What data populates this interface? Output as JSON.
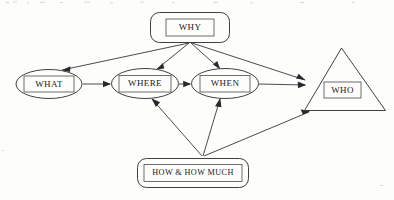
{
  "diagram": {
    "background_color": "#fdfdfc",
    "line_color": "#2a2a2a",
    "text_color": "#1a1a1a",
    "nodes": [
      {
        "id": "why",
        "label": "WHY",
        "shape": "rounded-rectangle",
        "x": 190,
        "y": 27
      },
      {
        "id": "what",
        "label": "WHAT",
        "shape": "ellipse",
        "x": 49,
        "y": 84
      },
      {
        "id": "where",
        "label": "WHERE",
        "shape": "ellipse",
        "x": 145,
        "y": 83
      },
      {
        "id": "when",
        "label": "WHEN",
        "shape": "ellipse",
        "x": 225,
        "y": 83
      },
      {
        "id": "who",
        "label": "WHO",
        "shape": "triangle",
        "x": 342,
        "y": 90
      },
      {
        "id": "how",
        "label": "HOW & HOW MUCH",
        "shape": "rounded-rectangle",
        "x": 193,
        "y": 173
      }
    ],
    "edges": [
      {
        "from": "why",
        "to": "what",
        "arrow": "single"
      },
      {
        "from": "why",
        "to": "where",
        "arrow": "single"
      },
      {
        "from": "why",
        "to": "when",
        "arrow": "single"
      },
      {
        "from": "why",
        "to": "who",
        "arrow": "single"
      },
      {
        "from": "what",
        "to": "where",
        "arrow": "single"
      },
      {
        "from": "where",
        "to": "when",
        "arrow": "single"
      },
      {
        "from": "when",
        "to": "who",
        "arrow": "single"
      },
      {
        "from": "how",
        "to": "where",
        "arrow": "single"
      },
      {
        "from": "how",
        "to": "when",
        "arrow": "single"
      },
      {
        "from": "how",
        "to": "who",
        "arrow": "single"
      }
    ]
  }
}
